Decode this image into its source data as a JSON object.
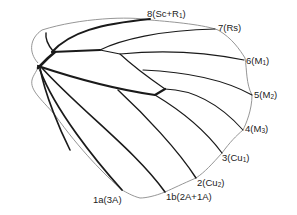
{
  "diagram": {
    "type": "butterfly-forewing-venation",
    "colors": {
      "outline": "#8a8a8a",
      "vein": "#1a1a1a",
      "text": "#222222"
    },
    "labels": [
      {
        "id": "v8",
        "num": "8",
        "paren_open": "(",
        "main": "Sc+R",
        "sub": "1",
        "paren_close": ")"
      },
      {
        "id": "v7",
        "num": "7",
        "paren_open": "(",
        "main": "Rs",
        "sub": "",
        "paren_close": ")"
      },
      {
        "id": "v6",
        "num": "6",
        "paren_open": "(",
        "main": "M",
        "sub": "1",
        "paren_close": ")"
      },
      {
        "id": "v5",
        "num": "5",
        "paren_open": "(",
        "main": "M",
        "sub": "2",
        "paren_close": ")"
      },
      {
        "id": "v4",
        "num": "4",
        "paren_open": "(",
        "main": "M",
        "sub": "3",
        "paren_close": ")"
      },
      {
        "id": "v3",
        "num": "3",
        "paren_open": "(",
        "main": "Cu",
        "sub": "1",
        "paren_close": ")"
      },
      {
        "id": "v2",
        "num": "2",
        "paren_open": "(",
        "main": "Cu",
        "sub": "2",
        "paren_close": ")"
      },
      {
        "id": "v1b",
        "num": "1b",
        "paren_open": "(",
        "main": "2A+1A",
        "sub": "",
        "paren_close": ")"
      },
      {
        "id": "v1a",
        "num": "1a",
        "paren_open": "(",
        "main": "3A",
        "sub": "",
        "paren_close": ")"
      }
    ]
  }
}
